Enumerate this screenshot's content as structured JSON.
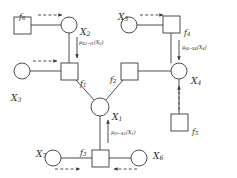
{
  "figure": {
    "stroke_color": "#3a3a3a",
    "text_color": "#2b2b2b",
    "background": "#ffffff"
  },
  "variable_nodes": [
    {
      "id": "X1",
      "label": "X",
      "subscript": "1",
      "shape": "circle",
      "cx": 100,
      "cy": 107,
      "r": 9,
      "label_x": 112,
      "label_y": 113
    },
    {
      "id": "X2",
      "label": "X",
      "subscript": "2",
      "shape": "circle",
      "cx": 69,
      "cy": 25,
      "r": 8,
      "label_x": 80,
      "label_y": 28
    },
    {
      "id": "X3",
      "label": "X",
      "subscript": "3",
      "shape": "circle",
      "cx": 22,
      "cy": 71,
      "r": 8,
      "label_x": 11,
      "label_y": 94
    },
    {
      "id": "X4",
      "label": "X",
      "subscript": "4",
      "shape": "circle",
      "cx": 179,
      "cy": 71,
      "r": 8,
      "label_x": 191,
      "label_y": 77
    },
    {
      "id": "X5",
      "label": "X",
      "subscript": "5",
      "shape": "circle",
      "cx": 129,
      "cy": 25,
      "r": 8,
      "label_x": 118,
      "label_y": 13
    },
    {
      "id": "X6",
      "label": "X",
      "subscript": "6",
      "shape": "circle",
      "cx": 139,
      "cy": 158,
      "r": 8,
      "label_x": 153,
      "label_y": 152
    },
    {
      "id": "X7",
      "label": "X",
      "subscript": "7",
      "shape": "circle",
      "cx": 53,
      "cy": 158,
      "r": 8,
      "label_x": 36,
      "label_y": 150
    }
  ],
  "factor_nodes": [
    {
      "id": "f1",
      "label": "f",
      "subscript": "1",
      "shape": "square",
      "x": 61,
      "y": 63,
      "w": 17,
      "h": 17,
      "label_x": 80,
      "label_y": 80
    },
    {
      "id": "f2",
      "label": "f",
      "subscript": "2",
      "shape": "square",
      "x": 121,
      "y": 63,
      "w": 17,
      "h": 17,
      "label_x": 110,
      "label_y": 76
    },
    {
      "id": "f3",
      "label": "f",
      "subscript": "3",
      "shape": "square",
      "x": 92,
      "y": 150,
      "w": 17,
      "h": 17,
      "label_x": 80,
      "label_y": 149
    },
    {
      "id": "f4",
      "label": "f",
      "subscript": "4",
      "shape": "square",
      "x": 163,
      "y": 16,
      "w": 17,
      "h": 17,
      "label_x": 184,
      "label_y": 29
    },
    {
      "id": "f5",
      "label": "f",
      "subscript": "5",
      "shape": "square",
      "x": 171,
      "y": 114,
      "w": 17,
      "h": 17,
      "label_x": 192,
      "label_y": 128
    },
    {
      "id": "f6",
      "label": "f",
      "subscript": "6",
      "shape": "square",
      "x": 14,
      "y": 17,
      "w": 17,
      "h": 17,
      "label_x": 19,
      "label_y": 13
    }
  ],
  "edges": [
    {
      "from": "f6",
      "to": "X2",
      "x1": 31,
      "y1": 25,
      "x2": 61,
      "y2": 25
    },
    {
      "from": "X2",
      "to": "f1",
      "x1": 69,
      "y1": 33,
      "x2": 69,
      "y2": 63
    },
    {
      "from": "X3",
      "to": "f1",
      "x1": 30,
      "y1": 71,
      "x2": 61,
      "y2": 71
    },
    {
      "from": "f1",
      "to": "X1",
      "x1": 76,
      "y1": 80,
      "x2": 95,
      "y2": 101
    },
    {
      "from": "f2",
      "to": "X1",
      "x1": 123,
      "y1": 80,
      "x2": 105,
      "y2": 101
    },
    {
      "from": "f2",
      "to": "X4",
      "x1": 138,
      "y1": 71,
      "x2": 171,
      "y2": 71
    },
    {
      "from": "X5",
      "to": "f4",
      "x1": 137,
      "y1": 25,
      "x2": 163,
      "y2": 25
    },
    {
      "from": "f4",
      "to": "X4",
      "x1": 171,
      "y1": 33,
      "x2": 171,
      "y2": 63
    },
    {
      "from": "X4",
      "to": "f5",
      "x1": 179,
      "y1": 79,
      "x2": 179,
      "y2": 114
    },
    {
      "from": "X1",
      "to": "f3",
      "x1": 100,
      "y1": 116,
      "x2": 100,
      "y2": 150
    },
    {
      "from": "X7",
      "to": "f3",
      "x1": 61,
      "y1": 158,
      "x2": 92,
      "y2": 158
    },
    {
      "from": "f3",
      "to": "X6",
      "x1": 109,
      "y1": 158,
      "x2": 131,
      "y2": 158
    }
  ],
  "message_arrows": [
    {
      "id": "msg-f6-X2",
      "style": "dashed",
      "direction": "right",
      "x1": 38,
      "y1": 15,
      "x2": 62,
      "y2": 15
    },
    {
      "id": "msg-X2-f1",
      "style": "solid",
      "direction": "down",
      "x1": 77,
      "y1": 37,
      "x2": 77,
      "y2": 58
    },
    {
      "id": "msg-X3-f1",
      "style": "dashed",
      "direction": "right",
      "x1": 33,
      "y1": 61,
      "x2": 57,
      "y2": 61
    },
    {
      "id": "msg-X5-f4",
      "style": "dashed",
      "direction": "right",
      "x1": 140,
      "y1": 15,
      "x2": 163,
      "y2": 15
    },
    {
      "id": "msg-f4-X4",
      "style": "solid",
      "direction": "down",
      "x1": 179,
      "y1": 40,
      "x2": 179,
      "y2": 60
    },
    {
      "id": "msg-f5-X4",
      "style": "dashed",
      "direction": "up",
      "x1": 179,
      "y1": 110,
      "x2": 179,
      "y2": 86
    },
    {
      "id": "msg-f3-X1",
      "style": "solid",
      "direction": "up",
      "x1": 108,
      "y1": 143,
      "x2": 108,
      "y2": 120
    },
    {
      "id": "msg-X7-f3",
      "style": "dashed",
      "direction": "right",
      "x1": 55,
      "y1": 169,
      "x2": 80,
      "y2": 169
    },
    {
      "id": "msg-X6-f3",
      "style": "dashed",
      "direction": "left",
      "x1": 137,
      "y1": 169,
      "x2": 114,
      "y2": 169
    }
  ],
  "message_labels": [
    {
      "id": "mu-X2-f1",
      "text": "μ",
      "from": "X",
      "from_sub": "2",
      "arrow": "→",
      "to": "f",
      "to_sub": "1",
      "argument": "(X",
      "arg_sub": "2",
      "argument_close": ")",
      "x": 79,
      "y": 40
    },
    {
      "id": "mu-f4-X4",
      "text": "μ",
      "from": "f",
      "from_sub": "4",
      "arrow": "→",
      "to": "X",
      "to_sub": "4",
      "argument": "(X",
      "arg_sub": "4",
      "argument_close": ")",
      "x": 182,
      "y": 45
    },
    {
      "id": "mu-f3-X1",
      "text": "μ",
      "from": "f",
      "from_sub": "3",
      "arrow": "→",
      "to": "X",
      "to_sub": "1",
      "argument": "(X",
      "arg_sub": "1",
      "argument_close": ")",
      "x": 111,
      "y": 130
    }
  ]
}
